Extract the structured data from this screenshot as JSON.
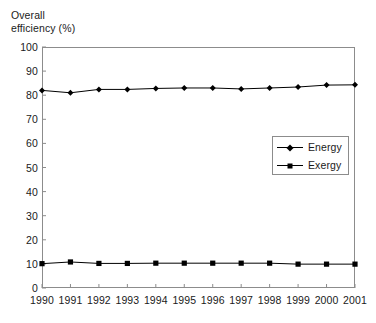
{
  "chart_data": {
    "type": "line",
    "title": "",
    "xlabel": "",
    "ylabel": "Overall efficiency (%)",
    "ylabel_lines": [
      "Overall",
      "efficiency (%)"
    ],
    "categories": [
      "1990",
      "1991",
      "1992",
      "1993",
      "1994",
      "1995",
      "1996",
      "1997",
      "1998",
      "1999",
      "2000",
      "2001"
    ],
    "x": [
      1990,
      1991,
      1992,
      1993,
      1994,
      1995,
      1996,
      1997,
      1998,
      1999,
      2000,
      2001
    ],
    "series": [
      {
        "name": "Energy",
        "marker": "diamond",
        "color": "#000000",
        "values": [
          82.0,
          81.0,
          82.4,
          82.4,
          82.8,
          83.0,
          83.0,
          82.6,
          83.0,
          83.4,
          84.2,
          84.3
        ]
      },
      {
        "name": "Exergy",
        "marker": "square",
        "color": "#000000",
        "values": [
          10.1,
          10.8,
          10.2,
          10.2,
          10.3,
          10.3,
          10.3,
          10.3,
          10.3,
          9.9,
          9.9,
          9.9
        ]
      }
    ],
    "ylim": [
      0,
      100
    ],
    "yticks": [
      0,
      10,
      20,
      30,
      40,
      50,
      60,
      70,
      80,
      90,
      100
    ],
    "ytick_labels": [
      "0",
      "10",
      "20",
      "30",
      "40",
      "50",
      "60",
      "70",
      "80",
      "90",
      "100"
    ],
    "xlim": [
      1990,
      2001
    ],
    "xticks": [
      1990,
      1991,
      1992,
      1993,
      1994,
      1995,
      1996,
      1997,
      1998,
      1999,
      2000,
      2001
    ],
    "grid": false,
    "legend": {
      "position": "center-right",
      "entries": [
        {
          "label": "Energy",
          "marker": "diamond"
        },
        {
          "label": "Exergy",
          "marker": "square"
        }
      ]
    },
    "frame_color": "#8c8c8c",
    "background": "#ffffff"
  },
  "caption": {
    "text": ""
  }
}
